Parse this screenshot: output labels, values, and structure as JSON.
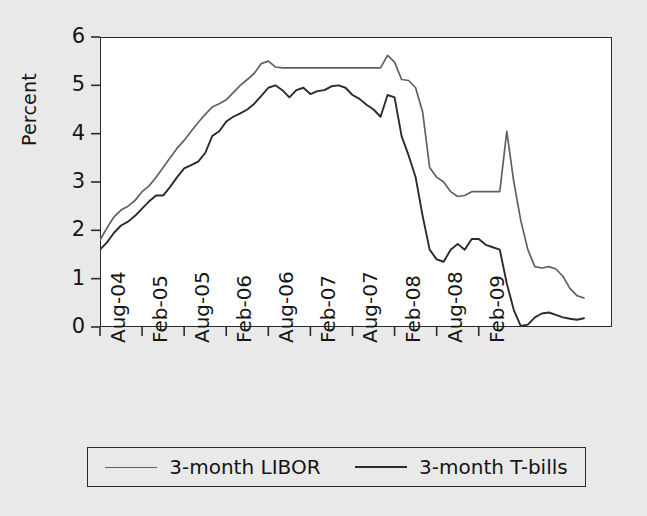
{
  "chart_data": {
    "type": "line",
    "title": "",
    "xlabel": "",
    "ylabel": "Percent",
    "ylim": [
      0,
      6
    ],
    "y_ticks": [
      "0",
      "1",
      "2",
      "3",
      "4",
      "5",
      "6"
    ],
    "x_ticks": [
      "Aug-04",
      "Feb-05",
      "Aug-05",
      "Feb-06",
      "Aug-06",
      "Feb-07",
      "Aug-07",
      "Feb-08",
      "Aug-08",
      "Feb-09"
    ],
    "grid": false,
    "legend_position": "bottom",
    "x_start": "Aug-04",
    "x_end": "Jul-09",
    "x_step_months": 1,
    "series": [
      {
        "name": "3-month LIBOR",
        "color": "#606060",
        "values": [
          1.8,
          2.05,
          2.28,
          2.42,
          2.5,
          2.62,
          2.8,
          2.92,
          3.1,
          3.3,
          3.5,
          3.7,
          3.86,
          4.05,
          4.23,
          4.4,
          4.55,
          4.62,
          4.7,
          4.85,
          5.0,
          5.12,
          5.25,
          5.45,
          5.5,
          5.38,
          5.36,
          5.36,
          5.36,
          5.36,
          5.36,
          5.36,
          5.36,
          5.36,
          5.36,
          5.36,
          5.36,
          5.36,
          5.36,
          5.36,
          5.36,
          5.62,
          5.48,
          5.12,
          5.1,
          4.95,
          4.45,
          3.3,
          3.1,
          3.0,
          2.8,
          2.7,
          2.72,
          2.8,
          2.8,
          2.8,
          2.8,
          2.8,
          4.05,
          3.0,
          2.2,
          1.6,
          1.25,
          1.22,
          1.25,
          1.2,
          1.05,
          0.8,
          0.65,
          0.6
        ]
      },
      {
        "name": "3-month T-bills",
        "color": "#2b2b2b",
        "values": [
          1.6,
          1.75,
          1.95,
          2.1,
          2.18,
          2.3,
          2.45,
          2.6,
          2.72,
          2.72,
          2.9,
          3.1,
          3.28,
          3.35,
          3.42,
          3.6,
          3.95,
          4.05,
          4.25,
          4.35,
          4.42,
          4.5,
          4.62,
          4.78,
          4.95,
          5.0,
          4.9,
          4.75,
          4.9,
          4.95,
          4.82,
          4.88,
          4.9,
          4.98,
          5.0,
          4.95,
          4.8,
          4.72,
          4.6,
          4.5,
          4.35,
          4.8,
          4.75,
          3.95,
          3.55,
          3.1,
          2.3,
          1.6,
          1.4,
          1.35,
          1.6,
          1.72,
          1.6,
          1.82,
          1.82,
          1.7,
          1.65,
          1.6,
          0.9,
          0.35,
          0.02,
          0.05,
          0.2,
          0.28,
          0.3,
          0.25,
          0.2,
          0.17,
          0.15,
          0.18
        ]
      }
    ]
  },
  "legend": {
    "entries": [
      {
        "label": "3-month LIBOR",
        "color": "#606060"
      },
      {
        "label": "3-month T-bills",
        "color": "#2b2b2b"
      }
    ]
  },
  "axis": {
    "y_title": "Percent"
  }
}
